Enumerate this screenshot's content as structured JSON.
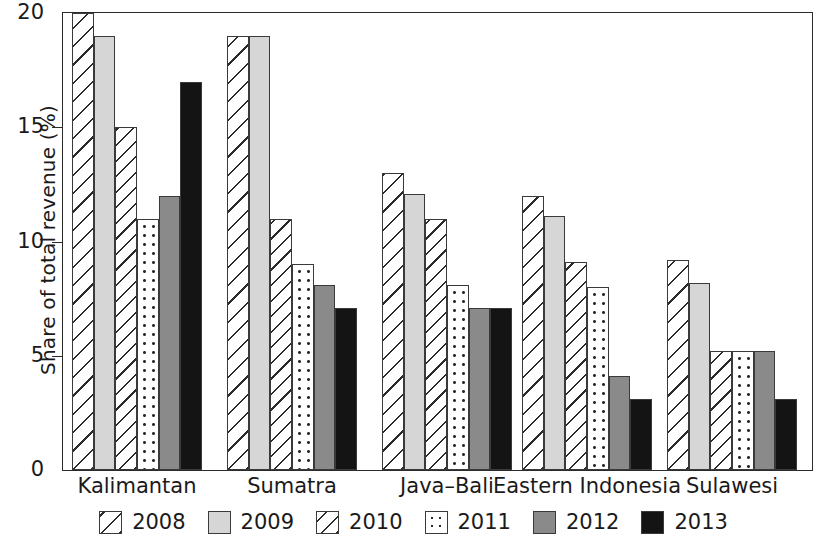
{
  "chart_data": {
    "type": "bar",
    "title": "",
    "xlabel": "",
    "ylabel": "Share of total revenue (%)",
    "ylim": [
      0,
      20
    ],
    "yticks": [
      0,
      5,
      10,
      15,
      20
    ],
    "ytick_labels": [
      "0",
      "5",
      "10",
      "15",
      "20"
    ],
    "grid": false,
    "legend_position": "bottom",
    "categories": [
      "Kalimantan",
      "Sumatra",
      "Java–Bali",
      "Eastern Indonesia",
      "Sulawesi"
    ],
    "series": [
      {
        "name": "2008",
        "values": [
          20,
          19,
          13,
          12,
          9.2
        ]
      },
      {
        "name": "2009",
        "values": [
          19,
          19,
          12.1,
          11.1,
          8.2
        ]
      },
      {
        "name": "2010",
        "values": [
          15,
          11,
          11,
          9.1,
          5.2
        ]
      },
      {
        "name": "2011",
        "values": [
          11,
          9,
          8.1,
          8,
          5.2
        ]
      },
      {
        "name": "2012",
        "values": [
          12,
          8.1,
          7.1,
          4.1,
          5.2
        ]
      },
      {
        "name": "2013",
        "values": [
          17,
          7.1,
          7.1,
          3.1,
          3.1
        ]
      }
    ]
  },
  "legend": {
    "items": [
      {
        "label": "2008",
        "pattern": "diagonal-hatch-wide",
        "color": "#ffffff"
      },
      {
        "label": "2009",
        "pattern": "solid",
        "color": "#d6d6d6"
      },
      {
        "label": "2010",
        "pattern": "diagonal-hatch-narrow",
        "color": "#ffffff"
      },
      {
        "label": "2011",
        "pattern": "dotted",
        "color": "#ffffff"
      },
      {
        "label": "2012",
        "pattern": "solid",
        "color": "#8a8a8a"
      },
      {
        "label": "2013",
        "pattern": "solid",
        "color": "#141414"
      }
    ]
  },
  "colors": {
    "axis": "#2b2b2b",
    "bar_outline": "#3a3a3a",
    "background": "#ffffff"
  }
}
